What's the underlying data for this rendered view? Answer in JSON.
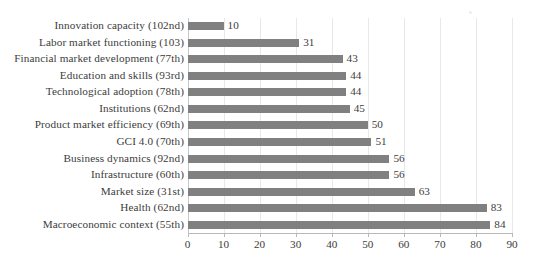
{
  "chart_data": {
    "type": "bar",
    "orientation": "horizontal",
    "title": "",
    "subtitle": "",
    "xlabel": "",
    "ylabel": "",
    "xlim": [
      0,
      90
    ],
    "xticks": [
      0,
      10,
      20,
      30,
      40,
      50,
      60,
      70,
      80,
      90
    ],
    "xtick_labels": [
      "0",
      "10",
      "20",
      "30",
      "40",
      "50",
      "60",
      "70",
      "80",
      "90"
    ],
    "grid": true,
    "grid_axis": "x",
    "legend": false,
    "data_labels": true,
    "bar_color": "#808080",
    "gridline_color": "#e8e8e8",
    "axis_color": "#b9b9b9",
    "text_color": "#3c3c3c",
    "categories": [
      "Innovation capacity (102nd)",
      "Labor market functioning (103)",
      "Financial market development (77th)",
      "Education and skills (93rd)",
      "Technological adoption (78th)",
      "Institutions (62nd)",
      "Product market efficiency (69th)",
      "GCI 4.0 (70th)",
      "Business dynamics (92nd)",
      "Infrastructure (60th)",
      "Market size (31st)",
      "Health (62nd)",
      "Macroeconomic context (55th)"
    ],
    "values": [
      10,
      31,
      43,
      44,
      44,
      45,
      50,
      51,
      56,
      56,
      63,
      83,
      84
    ],
    "value_labels": [
      "10",
      "31",
      "43",
      "44",
      "44",
      "45",
      "50",
      "51",
      "56",
      "56",
      "63",
      "83",
      "84"
    ]
  }
}
